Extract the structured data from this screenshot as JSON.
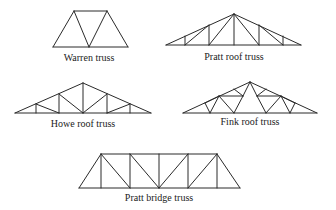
{
  "diagram": {
    "stroke_color": "#2a2a2a",
    "trusses": [
      {
        "name": "Warren truss",
        "label_pos": [
          89,
          52
        ],
        "lines": [
          [
            53,
            47,
            128,
            47
          ],
          [
            74,
            11,
            107,
            11
          ],
          [
            53,
            47,
            74,
            11
          ],
          [
            74,
            11,
            89,
            47
          ],
          [
            89,
            47,
            107,
            11
          ],
          [
            107,
            11,
            128,
            47
          ]
        ]
      },
      {
        "name": "Pratt roof truss",
        "label_pos": [
          234,
          51
        ],
        "lines": [
          [
            166,
            45,
            301,
            45
          ],
          [
            166,
            45,
            234,
            14
          ],
          [
            234,
            14,
            301,
            45
          ],
          [
            185,
            45,
            185,
            36
          ],
          [
            209,
            45,
            209,
            25
          ],
          [
            234,
            45,
            234,
            14
          ],
          [
            259,
            45,
            259,
            25
          ],
          [
            283,
            45,
            283,
            36
          ],
          [
            185,
            45,
            209,
            25
          ],
          [
            209,
            45,
            234,
            14
          ],
          [
            234,
            14,
            259,
            45
          ],
          [
            259,
            25,
            283,
            45
          ]
        ]
      },
      {
        "name": "Howe roof truss",
        "label_pos": [
          83,
          118
        ],
        "lines": [
          [
            15,
            113,
            151,
            113
          ],
          [
            15,
            113,
            83,
            83
          ],
          [
            83,
            83,
            151,
            113
          ],
          [
            36,
            113,
            36,
            104
          ],
          [
            59,
            113,
            59,
            94
          ],
          [
            83,
            113,
            83,
            83
          ],
          [
            107,
            113,
            107,
            94
          ],
          [
            130,
            113,
            130,
            104
          ],
          [
            36,
            104,
            59,
            113
          ],
          [
            59,
            94,
            83,
            113
          ],
          [
            83,
            113,
            107,
            94
          ],
          [
            107,
            113,
            130,
            104
          ]
        ]
      },
      {
        "name": "Fink roof truss",
        "label_pos": [
          250,
          116
        ],
        "lines": [
          [
            183,
            113,
            317,
            113
          ],
          [
            183,
            113,
            250,
            82
          ],
          [
            250,
            82,
            317,
            113
          ],
          [
            205,
            103,
            210,
            113
          ],
          [
            210,
            113,
            219,
            96
          ],
          [
            219,
            96,
            234,
            113
          ],
          [
            219,
            96,
            243,
            96
          ],
          [
            234,
            89,
            243,
            96
          ],
          [
            234,
            113,
            243,
            96
          ],
          [
            243,
            96,
            250,
            82
          ],
          [
            205,
            103,
            219,
            96
          ],
          [
            295,
            103,
            290,
            113
          ],
          [
            290,
            113,
            281,
            96
          ],
          [
            281,
            96,
            266,
            113
          ],
          [
            281,
            96,
            257,
            96
          ],
          [
            266,
            89,
            257,
            96
          ],
          [
            266,
            113,
            257,
            96
          ],
          [
            257,
            96,
            250,
            82
          ],
          [
            295,
            103,
            281,
            96
          ]
        ]
      },
      {
        "name": "Pratt bridge truss",
        "label_pos": [
          159,
          192
        ],
        "lines": [
          [
            79,
            188,
            240,
            188
          ],
          [
            101,
            154,
            217,
            154
          ],
          [
            79,
            188,
            101,
            154
          ],
          [
            217,
            154,
            240,
            188
          ],
          [
            101,
            154,
            101,
            188
          ],
          [
            130,
            154,
            130,
            188
          ],
          [
            159,
            154,
            159,
            188
          ],
          [
            188,
            154,
            188,
            188
          ],
          [
            217,
            154,
            217,
            188
          ],
          [
            101,
            154,
            130,
            188
          ],
          [
            130,
            154,
            159,
            188
          ],
          [
            159,
            188,
            188,
            154
          ],
          [
            188,
            188,
            217,
            154
          ]
        ]
      }
    ]
  }
}
